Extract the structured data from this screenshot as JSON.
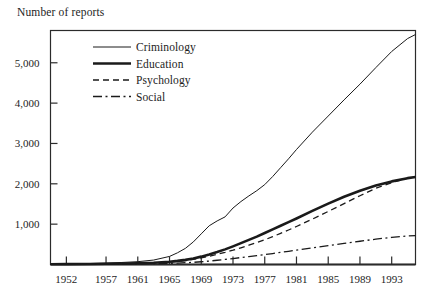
{
  "chart_data": {
    "type": "line",
    "title": "",
    "ylabel": "Number of reports",
    "xlabel": "",
    "grid": false,
    "legend_position": "top-left-inside",
    "ylim": [
      0,
      5800
    ],
    "xlim": [
      1950,
      1996
    ],
    "ytick_labels": [
      "1,000",
      "2,000",
      "3,000",
      "4,000",
      "5,000"
    ],
    "ytick_values": [
      1000,
      2000,
      3000,
      4000,
      5000
    ],
    "xtick_labels": [
      "1952",
      "1957",
      "1961",
      "1965",
      "1969",
      "1973",
      "1977",
      "1981",
      "1985",
      "1989",
      "1993"
    ],
    "xtick_values": [
      1952,
      1957,
      1961,
      1965,
      1969,
      1973,
      1977,
      1981,
      1985,
      1989,
      1993
    ],
    "x": [
      1950,
      1952,
      1955,
      1957,
      1959,
      1961,
      1963,
      1965,
      1966,
      1967,
      1968,
      1969,
      1970,
      1971,
      1972,
      1973,
      1974,
      1975,
      1976,
      1977,
      1978,
      1979,
      1980,
      1981,
      1983,
      1985,
      1987,
      1989,
      1991,
      1993,
      1995,
      1996
    ],
    "series": [
      {
        "name": "Criminology",
        "style": "solid-thin",
        "values": [
          10,
          15,
          25,
          35,
          50,
          70,
          110,
          200,
          290,
          400,
          560,
          760,
          960,
          1080,
          1180,
          1400,
          1560,
          1700,
          1830,
          1980,
          2180,
          2400,
          2620,
          2850,
          3280,
          3680,
          4080,
          4470,
          4880,
          5280,
          5600,
          5700
        ]
      },
      {
        "name": "Education",
        "style": "solid-thick",
        "values": [
          8,
          10,
          14,
          18,
          24,
          32,
          45,
          70,
          90,
          115,
          150,
          195,
          250,
          310,
          375,
          450,
          530,
          610,
          690,
          780,
          870,
          960,
          1050,
          1140,
          1330,
          1510,
          1680,
          1830,
          1960,
          2060,
          2140,
          2170
        ]
      },
      {
        "name": "Psychology",
        "style": "dashed",
        "values": [
          6,
          8,
          11,
          14,
          19,
          26,
          36,
          58,
          75,
          96,
          125,
          162,
          205,
          252,
          300,
          355,
          415,
          478,
          542,
          612,
          690,
          772,
          855,
          942,
          1125,
          1315,
          1510,
          1705,
          1890,
          2030,
          2140,
          2180
        ]
      },
      {
        "name": "Social",
        "style": "dash-dot",
        "values": [
          4,
          5,
          7,
          9,
          12,
          16,
          21,
          30,
          36,
          44,
          54,
          68,
          85,
          105,
          125,
          148,
          172,
          196,
          220,
          246,
          272,
          300,
          328,
          356,
          412,
          468,
          522,
          576,
          628,
          672,
          706,
          718
        ]
      }
    ]
  },
  "axes": {
    "frame_color": "#2b2b2b"
  }
}
